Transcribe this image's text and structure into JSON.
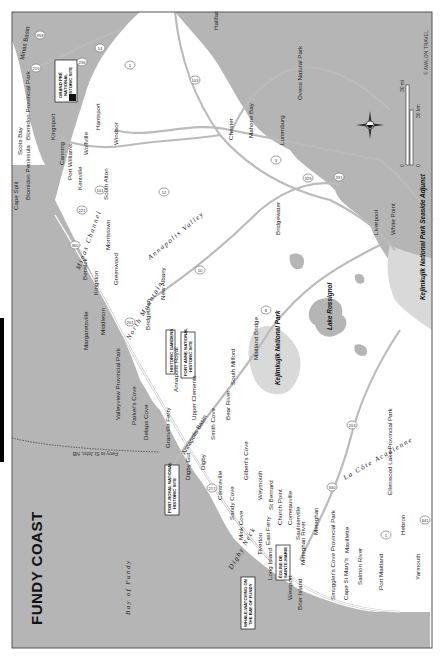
{
  "map": {
    "title": "FUNDY COAST",
    "credit": "© AVALON TRAVEL",
    "orientation": "rotated 90° counter-clockwise (north points left)",
    "colors": {
      "water": "#b5b5b5",
      "land": "#ffffff",
      "park": "#d9d9d9",
      "border": "#555555",
      "road": "#bbbbbb",
      "tab": "#000000"
    },
    "water_bodies": {
      "bay": "Bay of Fundy",
      "channel": "Minas Channel",
      "basin": "Minas Basin"
    },
    "regions": {
      "annapolis_valley": "Annapolis Valley",
      "north_mountain": "North Mountain",
      "digby_neck": "Digby Neck",
      "la_cote_acadienne": "La Côte Acadienne"
    },
    "ferry": "Ferry to St John, NB",
    "scale": {
      "mi_zero": "0",
      "mi_label": "30 mi",
      "km_zero": "0",
      "km_label": "30 km"
    },
    "callouts": [
      {
        "id": "grand-pre",
        "lines": [
          "GRAND PRÉ",
          "NATIONAL",
          "HISTORIC SITE"
        ]
      },
      {
        "id": "historic-gardens",
        "lines": [
          "HISTORIC GARDENS"
        ]
      },
      {
        "id": "fort-anne",
        "lines": [
          "FORT ANNE NATIONAL",
          "HISTORIC SITE"
        ]
      },
      {
        "id": "port-royal",
        "lines": [
          "PORT-ROYAL NATIONAL",
          "HISTORIC SITE"
        ]
      },
      {
        "id": "whale-watching",
        "lines": [
          "WHALE-WATCHING ON",
          "THE BAY OF FUNDY"
        ]
      },
      {
        "id": "eglise",
        "lines": [
          "ÉGLISE DE",
          "SAINTE-MARIE"
        ]
      }
    ],
    "parks": [
      "Blomidon Provincial Park",
      "Valleyview Provincial Park",
      "Kejimkujik National Park",
      "Kejimkujik National Park Seaside Adjunct",
      "Ovens Natural Park",
      "Smuggler's Cove Provincial Park",
      "Ellenwood Lake Provincial Park"
    ],
    "lakes": [
      "Lake Rossignol"
    ],
    "towns": [
      "Halifax",
      "Scots Bay",
      "Cape Split",
      "Blomidon Peninsula",
      "Kingsport",
      "Canning",
      "Port Williams",
      "Kentville",
      "Wolfville",
      "Hantsport",
      "Windsor",
      "South Alton",
      "Morristown",
      "Greenwood",
      "Berwick",
      "Kingston",
      "Margaretsville",
      "Middleton",
      "Bridgetown",
      "New Albany",
      "Annapolis Royal",
      "Parker's Cove",
      "Delaps Cove",
      "Granville Ferry",
      "Upper Clements",
      "Bear River",
      "Smith Cove",
      "Digby",
      "Digby Gut",
      "Annapolis Basin",
      "South Milford",
      "Maitland Bridge",
      "Gilbert's Cove",
      "Weymouth",
      "St Bernard",
      "Church Point",
      "Comeauville",
      "Saulnierville",
      "Meteghan",
      "Meteghan River",
      "Mavillette",
      "Cape St Mary's",
      "Salmon River",
      "Port Maitland",
      "Hebron",
      "Yarmouth",
      "Centreville",
      "Sandy Cove",
      "Mink Cove",
      "East Ferry",
      "Tiverton",
      "Long Island",
      "Westport",
      "Brier Island",
      "Chester",
      "Mahone Bay",
      "Lunenburg",
      "Bridgewater",
      "Liverpool",
      "White Point",
      "St Marys Bay"
    ],
    "highways": [
      "358",
      "101",
      "1",
      "14",
      "215",
      "236",
      "12",
      "103",
      "3",
      "325",
      "221",
      "360",
      "201",
      "10",
      "8",
      "217",
      "340",
      "203",
      "331",
      "341",
      "1"
    ]
  }
}
